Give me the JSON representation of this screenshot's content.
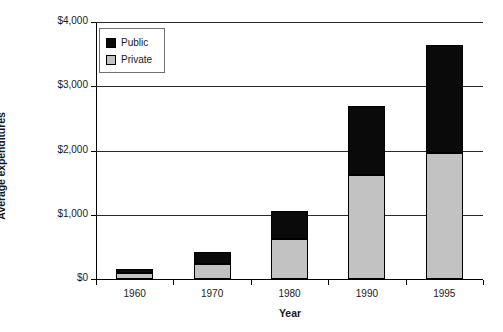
{
  "chart_data": {
    "type": "bar",
    "subtype": "stacked-vertical",
    "title": "",
    "xlabel": "Year",
    "ylabel": "Average expenditures",
    "categories": [
      "1960",
      "1970",
      "1980",
      "1990",
      "1995"
    ],
    "series": [
      {
        "name": "Private",
        "color": "#c2c2c2",
        "values": [
          95,
          230,
          620,
          1620,
          1965
        ]
      },
      {
        "name": "Public",
        "color": "#0a0a0a",
        "values": [
          60,
          185,
          445,
          1070,
          1685
        ]
      }
    ],
    "totals": [
      155,
      415,
      1065,
      2690,
      3650
    ],
    "stack_order": [
      "Private",
      "Public"
    ],
    "ylim": [
      0,
      4000
    ],
    "ytick_values": [
      0,
      1000,
      2000,
      3000,
      4000
    ],
    "ytick_labels": [
      "$0",
      "$1,000",
      "$2,000",
      "$3,000",
      "$4,000"
    ],
    "grid": "horizontal",
    "legend_position": "top-left-inside",
    "legend_entries": [
      "Public",
      "Private"
    ]
  },
  "legend": {
    "public_label": "Public",
    "private_label": "Private"
  },
  "axes": {
    "y_title": "Average expenditures",
    "x_title": "Year"
  },
  "colors": {
    "public": "#0a0a0a",
    "private": "#c2c2c2",
    "axis": "#000000",
    "grid": "#2b2b2b",
    "text": "#1a1a1a",
    "background": "#ffffff"
  }
}
